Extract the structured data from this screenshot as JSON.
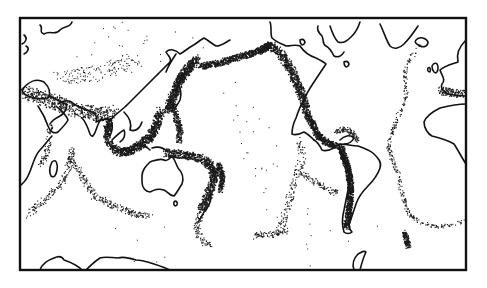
{
  "map": {
    "type": "world seismicity map",
    "projection": "Pacific-centered equirectangular",
    "style": "black and white line drawing",
    "colors": {
      "background": "#ffffff",
      "coastline": "#111111",
      "epicenter_dots": "#1a1a1a",
      "frame": "#111111"
    },
    "frame": {
      "x": 20,
      "y": 18,
      "width": 446,
      "height": 252
    },
    "features": {
      "coastlines": [
        "Eurasia",
        "Africa",
        "Australia",
        "North America",
        "South America",
        "Greenland",
        "Antarctica",
        "Madagascar",
        "Japan",
        "Indonesia",
        "British Isles",
        "Iceland",
        "New Zealand"
      ],
      "seismic_belts": [
        {
          "name": "Circum-Pacific belt (Ring of Fire)",
          "density": "very high"
        },
        {
          "name": "Alpide belt (Mediterranean-Himalaya)",
          "density": "moderate"
        },
        {
          "name": "Mid-Atlantic Ridge",
          "density": "low"
        },
        {
          "name": "Indian Ocean ridges",
          "density": "low"
        },
        {
          "name": "East Pacific Rise",
          "density": "low"
        },
        {
          "name": "Pacific-Antarctic Ridge",
          "density": "low"
        },
        {
          "name": "South Sandwich arc",
          "density": "moderate"
        }
      ]
    },
    "text_labels": []
  }
}
